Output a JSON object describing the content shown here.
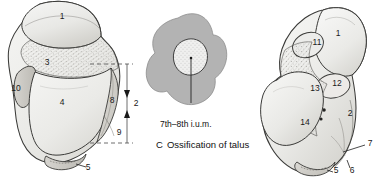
{
  "figure": {
    "caption_letter": "C",
    "caption_title": "Ossification of talus",
    "age_label": "7th–8th i.u.m.",
    "background_color": "#ffffff",
    "ink_color": "#2b2b2b",
    "bone_fill_light": "#ededeb",
    "bone_fill_mid": "#d9d8d4",
    "bone_fill_shadow": "#bfbdb8",
    "ossification_outline_fill": "#b3b3b3",
    "ossification_center_fill": "#efefee"
  },
  "left_panel": {
    "name": "talus-superior-view",
    "labels": [
      {
        "text": "1",
        "x": 62,
        "y": 16
      },
      {
        "text": "3",
        "x": 47,
        "y": 62
      },
      {
        "text": "10",
        "x": 16,
        "y": 88
      },
      {
        "text": "4",
        "x": 62,
        "y": 102
      },
      {
        "text": "8",
        "x": 112,
        "y": 100
      },
      {
        "text": "9",
        "x": 119,
        "y": 132
      },
      {
        "text": "5",
        "x": 88,
        "y": 167
      }
    ]
  },
  "dimension": {
    "name": "height-dimension",
    "label": "2",
    "label_x": 136,
    "label_y": 103,
    "top_y": 64,
    "bottom_y": 143,
    "line_x": 127,
    "dash_start_x": 90,
    "dash_end_x": 133
  },
  "middle_panel": {
    "name": "ossification-diagram",
    "leader_line": {
      "x1": 196,
      "y1": 62,
      "x2": 196,
      "y2": 118
    }
  },
  "right_panel": {
    "name": "talus-inferior-view",
    "labels": [
      {
        "text": "1",
        "x": 338,
        "y": 33
      },
      {
        "text": "11",
        "x": 317,
        "y": 42
      },
      {
        "text": "12",
        "x": 337,
        "y": 83
      },
      {
        "text": "13",
        "x": 315,
        "y": 88
      },
      {
        "text": "2",
        "x": 350,
        "y": 113
      },
      {
        "text": "14",
        "x": 305,
        "y": 122
      },
      {
        "text": "7",
        "x": 370,
        "y": 143
      },
      {
        "text": "5",
        "x": 336,
        "y": 170
      },
      {
        "text": "6",
        "x": 352,
        "y": 170
      }
    ]
  }
}
